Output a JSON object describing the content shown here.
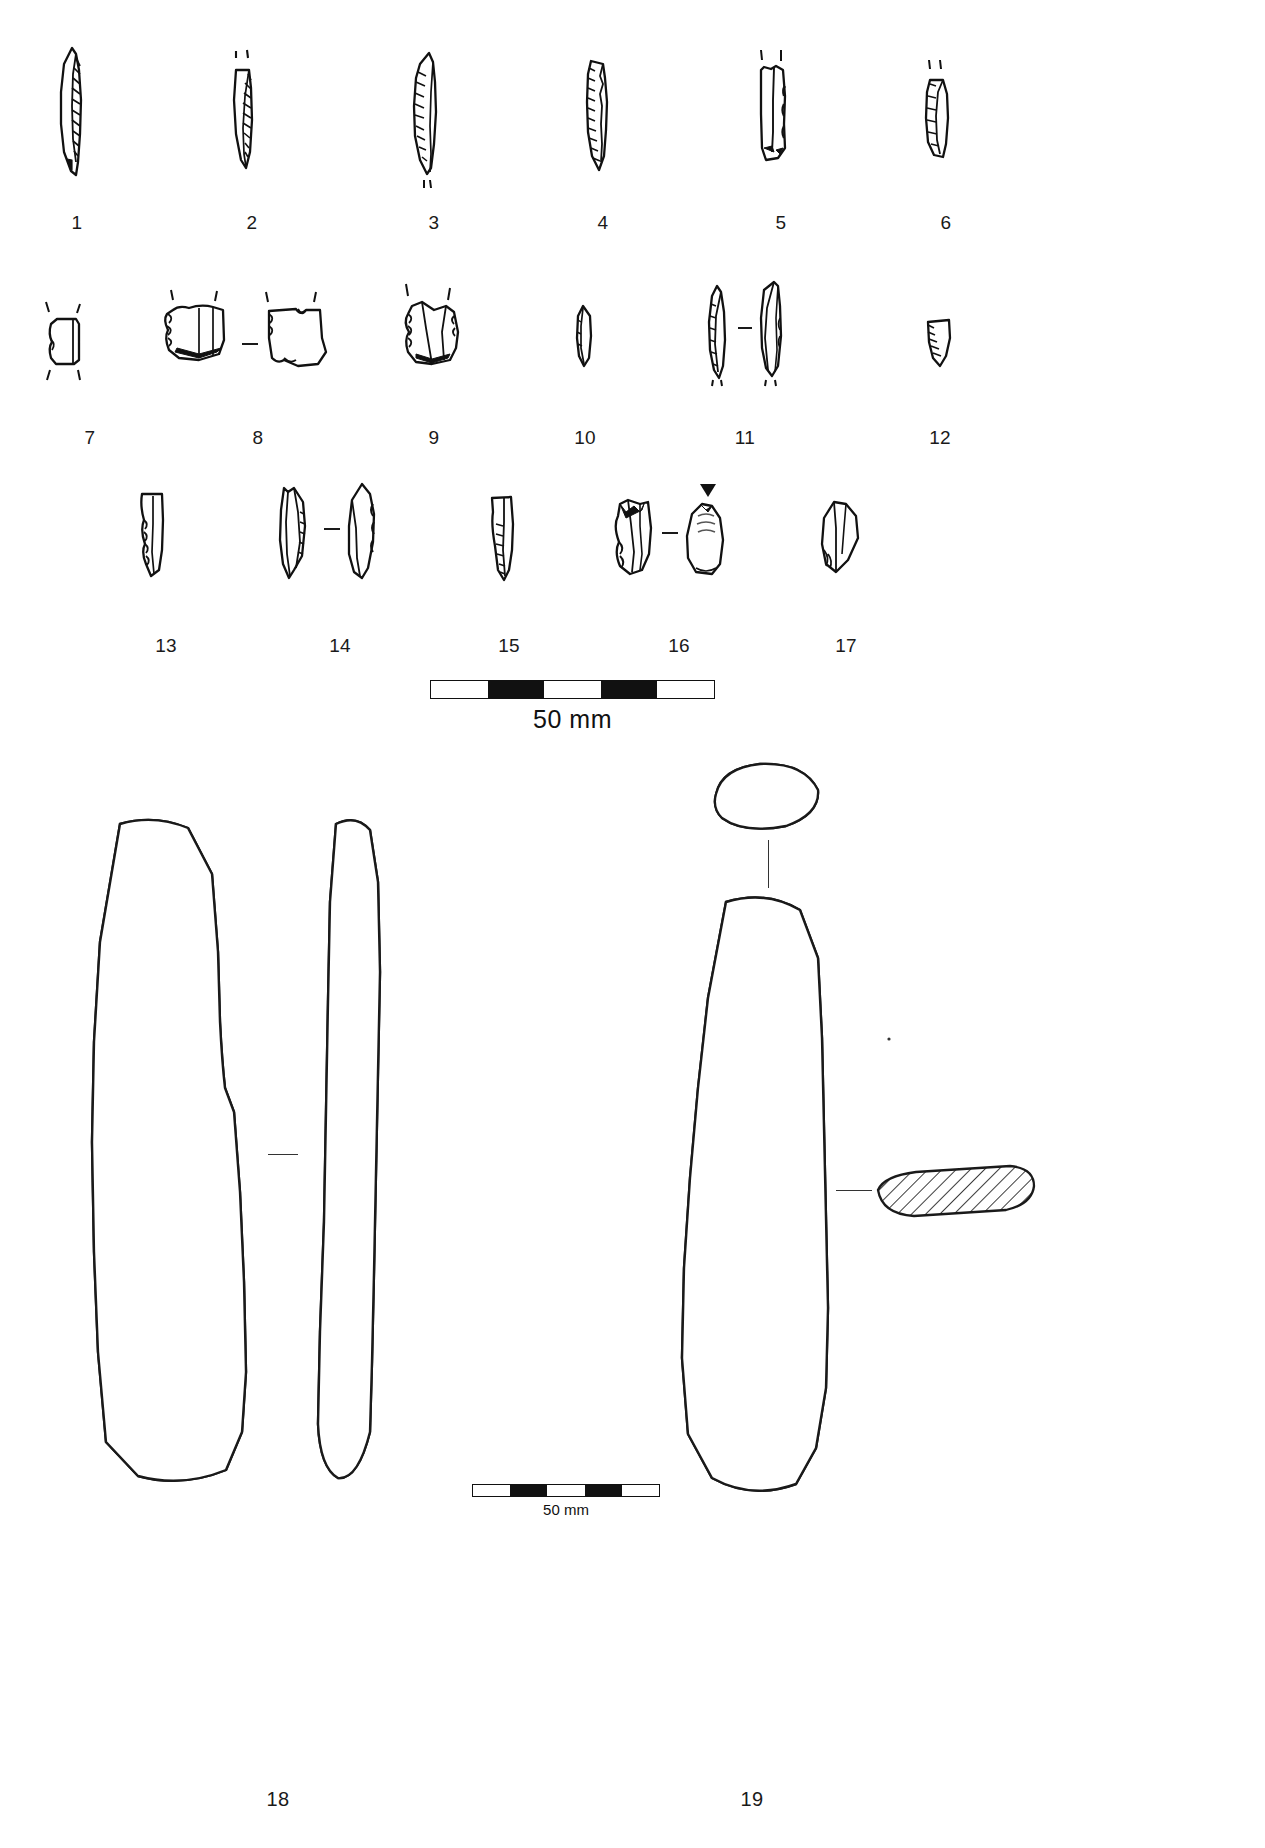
{
  "figure": {
    "kind": "archaeological-artefact-plate",
    "background_color": "#ffffff",
    "ink_color": "#111111"
  },
  "rows": [
    {
      "name": "row-1-blades",
      "labels": [
        "1",
        "2",
        "3",
        "4",
        "5",
        "6"
      ]
    },
    {
      "name": "row-2-blades",
      "labels": [
        "7",
        "8",
        "9",
        "10",
        "11",
        "12"
      ]
    },
    {
      "name": "row-3-blades",
      "labels": [
        "13",
        "14",
        "15",
        "16",
        "17"
      ]
    },
    {
      "name": "row-4-adzes",
      "labels": [
        "18",
        "19"
      ]
    }
  ],
  "labels": {
    "l1": "1",
    "l2": "2",
    "l3": "3",
    "l4": "4",
    "l5": "5",
    "l6": "6",
    "l7": "7",
    "l8": "8",
    "l9": "9",
    "l10": "10",
    "l11": "11",
    "l12": "12",
    "l13": "13",
    "l14": "14",
    "l15": "15",
    "l16": "16",
    "l17": "17",
    "l18": "18",
    "l19": "19"
  },
  "scalebars": {
    "top": {
      "caption": "50 mm",
      "segments": [
        "light",
        "dark",
        "light",
        "dark",
        "light"
      ]
    },
    "bottom": {
      "caption": "50 mm",
      "segments": [
        "light",
        "dark",
        "light",
        "dark",
        "light"
      ]
    }
  },
  "artifacts": [
    {
      "id": "1",
      "type": "retouched-blade",
      "views": 1,
      "label": "1"
    },
    {
      "id": "2",
      "type": "backed-bladelet",
      "views": 1,
      "label": "2"
    },
    {
      "id": "3",
      "type": "retouched-blade",
      "views": 1,
      "label": "3"
    },
    {
      "id": "4",
      "type": "retouched-bladelet",
      "views": 1,
      "label": "4"
    },
    {
      "id": "5",
      "type": "prismatic-blade-fragment",
      "views": 1,
      "label": "5"
    },
    {
      "id": "6",
      "type": "blade-fragment",
      "views": 1,
      "label": "6"
    },
    {
      "id": "7",
      "type": "truncated-flake",
      "views": 1,
      "label": "7"
    },
    {
      "id": "8",
      "type": "denticulate-flake-pair",
      "views": 2,
      "label": "8"
    },
    {
      "id": "9",
      "type": "retouched-flake",
      "views": 1,
      "label": "9"
    },
    {
      "id": "10",
      "type": "small-flake",
      "views": 1,
      "label": "10"
    },
    {
      "id": "11",
      "type": "blade-pair",
      "views": 2,
      "label": "11"
    },
    {
      "id": "12",
      "type": "notched-fragment",
      "views": 1,
      "label": "12"
    },
    {
      "id": "13",
      "type": "retouched-blade",
      "views": 1,
      "label": "13"
    },
    {
      "id": "14",
      "type": "burin-pair",
      "views": 2,
      "label": "14"
    },
    {
      "id": "15",
      "type": "narrow-blade",
      "views": 1,
      "label": "15"
    },
    {
      "id": "16",
      "type": "core-fragment-pair",
      "views": 2,
      "label": "16"
    },
    {
      "id": "17",
      "type": "triangular-flake",
      "views": 1,
      "label": "17"
    },
    {
      "id": "18",
      "type": "ground-stone-adze",
      "views": 2,
      "label": "18"
    },
    {
      "id": "19",
      "type": "ground-stone-adze",
      "views": 1,
      "label": "19"
    }
  ],
  "annotations": {
    "arrow_marker": "percussion-direction-arrow",
    "section_18": "profile-view",
    "section_19_top": "stippled-oval-cross-section",
    "section_19_side": "hatched-elongated-cross-section"
  }
}
